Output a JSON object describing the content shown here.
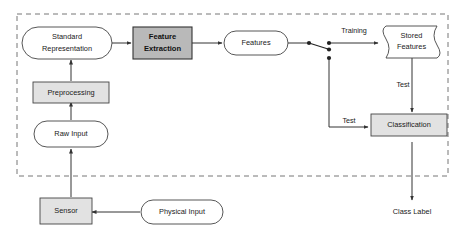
{
  "diagram": {
    "colors": {
      "process_fill": "#e2e2e2",
      "highlight_fill": "#b9b9b9",
      "data_fill": "#ffffff",
      "stroke": "#444444",
      "dashed_stroke": "#777777",
      "text": "#1a1a1a",
      "background": "#ffffff"
    },
    "region": {
      "name": "dashed-boundary",
      "style": "dashed rectangle"
    },
    "nodes": [
      {
        "id": "standard-representation",
        "label_line1": "Standard",
        "label_line2": "Representation",
        "shape": "rounded",
        "fill": "#ffffff",
        "bold": false
      },
      {
        "id": "feature-extraction",
        "label_line1": "Feature",
        "label_line2": "Extraction",
        "shape": "rectangle",
        "fill": "#b9b9b9",
        "bold": true
      },
      {
        "id": "features",
        "label_line1": "Features",
        "label_line2": "",
        "shape": "rounded",
        "fill": "#ffffff",
        "bold": false
      },
      {
        "id": "stored-features",
        "label_line1": "Stored",
        "label_line2": "Features",
        "shape": "document",
        "fill": "#ffffff",
        "bold": false
      },
      {
        "id": "preprocessing",
        "label_line1": "Preprocessing",
        "label_line2": "",
        "shape": "rectangle",
        "fill": "#e2e2e2",
        "bold": false
      },
      {
        "id": "raw-input",
        "label_line1": "Raw Input",
        "label_line2": "",
        "shape": "rounded",
        "fill": "#ffffff",
        "bold": false
      },
      {
        "id": "classification",
        "label_line1": "Classification",
        "label_line2": "",
        "shape": "rectangle",
        "fill": "#e2e2e2",
        "bold": false
      },
      {
        "id": "sensor",
        "label_line1": "Sensor",
        "label_line2": "",
        "shape": "rectangle",
        "fill": "#e2e2e2",
        "bold": false
      },
      {
        "id": "physical-input",
        "label_line1": "Physical Input",
        "label_line2": "",
        "shape": "rounded",
        "fill": "#ffffff",
        "bold": false
      }
    ],
    "edge_labels": {
      "training": "Training",
      "test_vertical": "Test",
      "test_horizontal": "Test"
    },
    "outputs": {
      "class_label": "Class Label"
    },
    "switch": {
      "name": "training-test-selector",
      "description": "two-position switch routing Features to Training or Test"
    }
  }
}
